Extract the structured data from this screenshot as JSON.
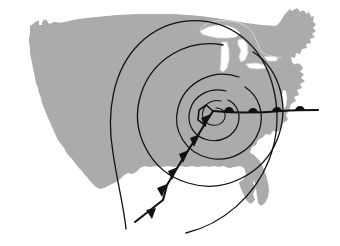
{
  "figure": {
    "title": "Mid-latitude cyclone over the contiguous United States",
    "background_color": "#ffffff"
  },
  "basemap": {
    "name": "contiguous-united-states",
    "land_fill": "#ababab",
    "water_fill": "#ffffff",
    "lake_outline": "#d9d9d9",
    "lakes": [
      "lake-superior",
      "lake-michigan",
      "lake-huron",
      "lake-erie",
      "lake-ontario"
    ]
  },
  "weather_system": {
    "type": "mid-latitude-cyclone",
    "line_color": "#111111",
    "low_center": {
      "name": "surface-low-center",
      "x": 213,
      "y": 111
    },
    "isobars": {
      "name": "isobar-spirals",
      "count": 5,
      "stroke_width": 1.3,
      "shape": "counterclockwise-spiral"
    },
    "cold_front": {
      "name": "cold-front",
      "symbol": "triangle",
      "symbol_count": 6,
      "direction": "southwest",
      "start": {
        "x": 213,
        "y": 111
      },
      "bend": {
        "x": 163,
        "y": 200
      },
      "end": {
        "x": 135,
        "y": 222
      }
    },
    "warm_front": {
      "name": "warm-front",
      "symbol": "semicircle",
      "symbol_count": 4,
      "direction": "east",
      "start": {
        "x": 213,
        "y": 111
      },
      "end": {
        "x": 318,
        "y": 110
      }
    }
  }
}
